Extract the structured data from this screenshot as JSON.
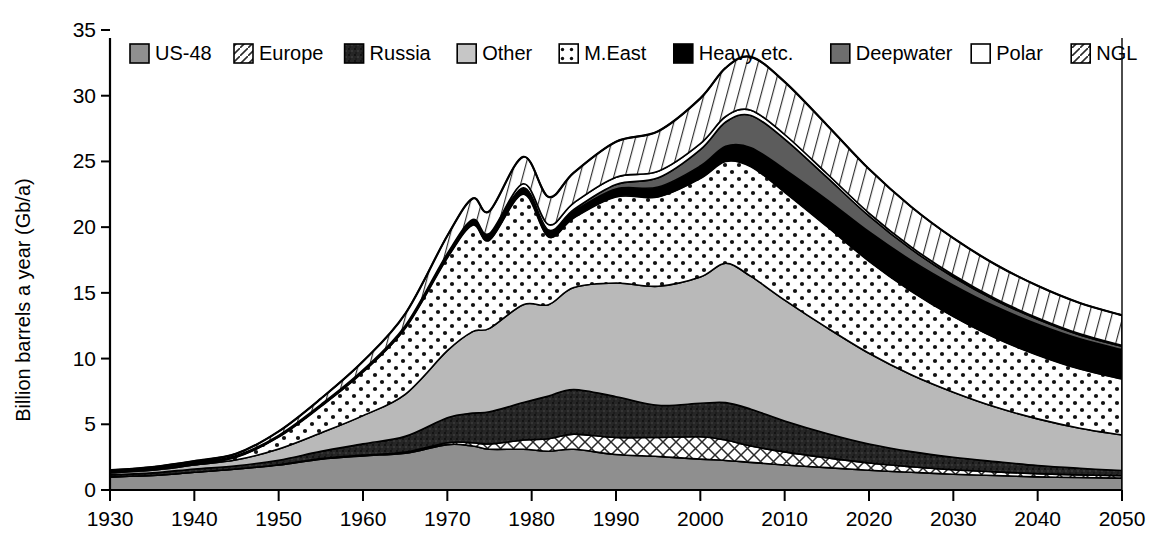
{
  "chart_data": {
    "type": "area",
    "stacked": true,
    "title": "",
    "xlabel": "",
    "ylabel": "Billion barrels a year (Gb/a)",
    "xlim": [
      1930,
      2050
    ],
    "ylim": [
      0,
      35
    ],
    "ytick_step": 5,
    "xtick_step": 10,
    "grid": false,
    "legend_position": "top-inside",
    "xticks": [
      1930,
      1940,
      1950,
      1960,
      1970,
      1980,
      1990,
      2000,
      2010,
      2020,
      2030,
      2040,
      2050
    ],
    "yticks": [
      0,
      5,
      10,
      15,
      20,
      25,
      30,
      35
    ],
    "x": [
      1930,
      1935,
      1940,
      1945,
      1950,
      1955,
      1960,
      1965,
      1970,
      1973,
      1975,
      1979,
      1982,
      1985,
      1990,
      1995,
      2000,
      2003,
      2006,
      2010,
      2015,
      2020,
      2025,
      2030,
      2035,
      2040,
      2045,
      2050
    ],
    "series": [
      {
        "name": "US-48",
        "pattern": "solid-mediumgray",
        "color": "#8f8f8f",
        "values": [
          1.0,
          1.1,
          1.35,
          1.6,
          1.9,
          2.35,
          2.6,
          2.8,
          3.45,
          3.35,
          3.1,
          3.1,
          2.95,
          3.1,
          2.7,
          2.55,
          2.35,
          2.25,
          2.1,
          1.9,
          1.7,
          1.5,
          1.35,
          1.2,
          1.1,
          1.0,
          0.95,
          0.9
        ]
      },
      {
        "name": "Europe",
        "pattern": "crosshatch",
        "color": "#ffffff",
        "values": [
          0.0,
          0.0,
          0.0,
          0.0,
          0.02,
          0.04,
          0.06,
          0.08,
          0.15,
          0.25,
          0.4,
          0.7,
          0.95,
          1.15,
          1.3,
          1.45,
          1.7,
          1.55,
          1.25,
          1.0,
          0.75,
          0.55,
          0.42,
          0.34,
          0.28,
          0.24,
          0.2,
          0.18
        ]
      },
      {
        "name": "Russia",
        "pattern": "speckle-dark",
        "color": "#262626",
        "values": [
          0.15,
          0.2,
          0.25,
          0.25,
          0.35,
          0.55,
          0.85,
          1.2,
          1.9,
          2.25,
          2.45,
          2.85,
          3.25,
          3.4,
          3.1,
          2.45,
          2.55,
          2.85,
          2.8,
          2.35,
          1.85,
          1.45,
          1.15,
          0.95,
          0.78,
          0.62,
          0.5,
          0.4
        ]
      },
      {
        "name": "Other",
        "pattern": "solid-lightgray",
        "color": "#b9b9b9",
        "values": [
          0.15,
          0.2,
          0.3,
          0.45,
          0.85,
          1.4,
          2.15,
          3.2,
          5.1,
          6.2,
          6.35,
          7.45,
          6.95,
          7.75,
          8.65,
          9.05,
          9.6,
          10.6,
          10.1,
          9.2,
          8.05,
          6.9,
          5.85,
          4.95,
          4.15,
          3.55,
          3.05,
          2.7
        ]
      },
      {
        "name": "M.East",
        "pattern": "dots",
        "color": "#ffffff",
        "values": [
          0.05,
          0.08,
          0.1,
          0.2,
          0.9,
          2.0,
          3.3,
          5.0,
          7.05,
          8.1,
          6.7,
          8.4,
          5.15,
          5.3,
          6.55,
          6.8,
          7.5,
          7.75,
          8.35,
          8.2,
          7.7,
          7.0,
          6.35,
          5.75,
          5.25,
          4.85,
          4.5,
          4.25
        ]
      },
      {
        "name": "Heavy etc.",
        "pattern": "solid-black",
        "color": "#000000",
        "values": [
          0.1,
          0.1,
          0.1,
          0.12,
          0.14,
          0.16,
          0.18,
          0.22,
          0.3,
          0.35,
          0.38,
          0.45,
          0.45,
          0.5,
          0.6,
          0.75,
          0.95,
          1.15,
          1.45,
          1.75,
          2.05,
          2.25,
          2.35,
          2.4,
          2.4,
          2.35,
          2.3,
          2.25
        ]
      },
      {
        "name": "Deepwater",
        "pattern": "solid-darkgray",
        "color": "#5c5c5c",
        "values": [
          0.0,
          0.0,
          0.0,
          0.0,
          0.0,
          0.0,
          0.0,
          0.0,
          0.0,
          0.0,
          0.02,
          0.05,
          0.08,
          0.15,
          0.35,
          0.7,
          1.25,
          1.85,
          2.45,
          2.3,
          1.7,
          1.2,
          0.85,
          0.62,
          0.48,
          0.38,
          0.3,
          0.25
        ]
      },
      {
        "name": "Polar",
        "pattern": "solid-white",
        "color": "#ffffff",
        "values": [
          0.0,
          0.0,
          0.0,
          0.0,
          0.0,
          0.0,
          0.0,
          0.0,
          0.05,
          0.08,
          0.12,
          0.3,
          0.42,
          0.5,
          0.55,
          0.5,
          0.45,
          0.42,
          0.4,
          0.35,
          0.28,
          0.22,
          0.18,
          0.15,
          0.12,
          0.1,
          0.08,
          0.07
        ]
      },
      {
        "name": "NGL",
        "pattern": "diagonal-hatch",
        "color": "#ffffff",
        "values": [
          0.05,
          0.07,
          0.1,
          0.15,
          0.3,
          0.45,
          0.65,
          0.9,
          1.35,
          1.6,
          1.7,
          2.05,
          2.1,
          2.3,
          2.7,
          3.05,
          3.45,
          3.7,
          4.05,
          4.0,
          3.7,
          3.35,
          3.05,
          2.8,
          2.6,
          2.45,
          2.35,
          2.3
        ]
      }
    ],
    "annotations": {
      "total_peak_year": 2006,
      "total_peak_value": 31.0,
      "total_at_1930": 1.3,
      "total_at_1979": 24.0,
      "total_at_2050": 12.5
    }
  },
  "legend": {
    "items": [
      {
        "label": "US-48",
        "swatch": "swatch-us48"
      },
      {
        "label": "Europe",
        "swatch": "swatch-europe"
      },
      {
        "label": "Russia",
        "swatch": "swatch-russia"
      },
      {
        "label": "Other",
        "swatch": "swatch-other"
      },
      {
        "label": "M.East",
        "swatch": "swatch-meast"
      },
      {
        "label": "Heavy etc.",
        "swatch": "swatch-heavy"
      },
      {
        "label": "Deepwater",
        "swatch": "swatch-deepwater"
      },
      {
        "label": "Polar",
        "swatch": "swatch-polar"
      },
      {
        "label": "NGL",
        "swatch": "swatch-ngl"
      }
    ]
  },
  "axes": {
    "y_title": "Billion barrels a year (Gb/a)",
    "y_labels": [
      "0",
      "5",
      "10",
      "15",
      "20",
      "25",
      "30",
      "35"
    ],
    "x_labels": [
      "1930",
      "1940",
      "1950",
      "1960",
      "1970",
      "1980",
      "1990",
      "2000",
      "2010",
      "2020",
      "2030",
      "2040",
      "2050"
    ]
  },
  "colors": {
    "us48": "#8f8f8f",
    "russia": "#262626",
    "other": "#b9b9b9",
    "heavy": "#000000",
    "deepwater": "#5c5c5c",
    "axis": "#000000",
    "background": "#ffffff"
  }
}
